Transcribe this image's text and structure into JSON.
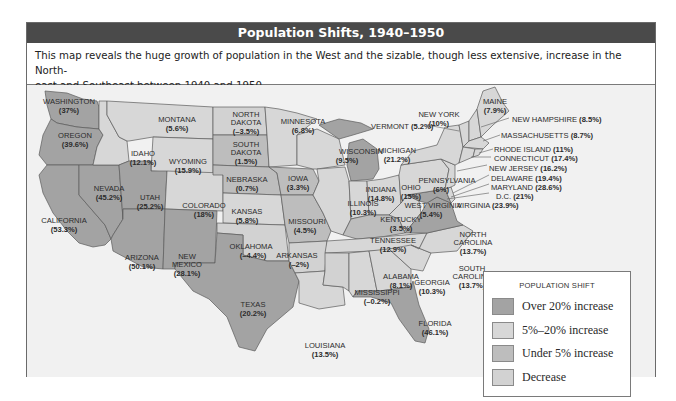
{
  "title": "Population Shifts, 1940–1950",
  "caption": "This map reveals the huge growth of population in the West and the sizable, though less extensive, increase in the North-east and Southeast between 1940 and 1950.",
  "caption_line1": "This map reveals the huge growth of population in the West and the sizable, though less extensive, increase in the North-",
  "caption_line2": "east and Southeast between 1940 and 1950.",
  "colors": {
    "over20": "#a3a3a3",
    "5to20": "#d7d7d7",
    "under5": "#bdbdbd",
    "decrease": "#d2d2d2",
    "background": "#f1f1f1",
    "titlebar": "#4a4a4a"
  },
  "legend": {
    "title": "POPULATION SHIFT",
    "items": [
      {
        "label": "Over 20% increase",
        "category": "over20"
      },
      {
        "label": "5%–20% increase",
        "category": "5to20"
      },
      {
        "label": "Under 5% increase",
        "category": "under5"
      },
      {
        "label": "Decrease",
        "category": "decrease"
      }
    ]
  },
  "states": {
    "washington": {
      "name": "WASHINGTON",
      "value": "(37%)"
    },
    "oregon": {
      "name": "OREGON",
      "value": "(39.6%)"
    },
    "california": {
      "name": "CALIFORNIA",
      "value": "(53.3%)"
    },
    "nevada": {
      "name": "NEVADA",
      "value": "(45.2%)"
    },
    "idaho": {
      "name": "IDAHO",
      "value": "(12.1%)"
    },
    "montana": {
      "name": "MONTANA",
      "value": "(5.6%)"
    },
    "wyoming": {
      "name": "WYOMING",
      "value": "(15.9%)"
    },
    "utah": {
      "name": "UTAH",
      "value": "(25.2%)"
    },
    "colorado": {
      "name": "COLORADO",
      "value": "(18%)"
    },
    "arizona": {
      "name": "ARIZONA",
      "value": "(50.1%)"
    },
    "new_mexico": {
      "name1": "NEW",
      "name2": "MEXICO",
      "value": "(28.1%)"
    },
    "north_dakota": {
      "name1": "NORTH",
      "name2": "DAKOTA",
      "value": "(–3.5%)"
    },
    "south_dakota": {
      "name1": "SOUTH",
      "name2": "DAKOTA",
      "value": "(1.5%)"
    },
    "nebraska": {
      "name": "NEBRASKA",
      "value": "(0.7%)"
    },
    "kansas": {
      "name": "KANSAS",
      "value": "(5.8%)"
    },
    "oklahoma": {
      "name": "OKLAHOMA",
      "value": "(–4.4%)"
    },
    "texas": {
      "name": "TEXAS",
      "value": "(20.2%)"
    },
    "minnesota": {
      "name": "MINNESOTA",
      "value": "(6.8%)"
    },
    "iowa": {
      "name": "IOWA",
      "value": "(3.3%)"
    },
    "missouri": {
      "name": "MISSOURI",
      "value": "(4.5%)"
    },
    "arkansas": {
      "name": "ARKANSAS",
      "value": "(–2%)"
    },
    "louisiana": {
      "name": "LOUISIANA",
      "value": "(13.5%)"
    },
    "wisconsin": {
      "name": "WISCONSIN",
      "value": "(9.5%)"
    },
    "illinois": {
      "name": "ILLINOIS",
      "value": "(10.3%)"
    },
    "michigan": {
      "name": "MICHIGAN",
      "value": "(21.2%)"
    },
    "indiana": {
      "name": "INDIANA",
      "value": "(14.8%)"
    },
    "ohio": {
      "name": "OHIO",
      "value": "(15%)"
    },
    "kentucky": {
      "name": "KENTUCKY",
      "value": "(3.5%)"
    },
    "tennessee": {
      "name": "TENNESSEE",
      "value": "(12.9%)"
    },
    "mississippi": {
      "name": "MISSISSIPPI",
      "value": "(–0.2%)"
    },
    "alabama": {
      "name": "ALABAMA",
      "value": "(8.1%)"
    },
    "georgia": {
      "name": "GEORGIA",
      "value": "(10.3%)"
    },
    "florida": {
      "name": "FLORIDA",
      "value": "(46.1%)"
    },
    "south_carolina": {
      "name1": "SOUTH",
      "name2": "CAROLINA",
      "value": "(13.7%)"
    },
    "north_carolina": {
      "name1": "NORTH",
      "name2": "CAROLINA",
      "value": "(13.7%)"
    },
    "virginia": {
      "name": "VIRGINIA",
      "value": "(23.9%)"
    },
    "west_virginia": {
      "name": "WEST VIRGINIA",
      "value": "(5.4%)"
    },
    "pennsylvania": {
      "name": "PENNSYLVANIA",
      "value": "(6%)"
    },
    "new_york": {
      "name": "NEW YORK",
      "value": "(10%)"
    },
    "vermont": {
      "name": "VERMONT",
      "value": "(5.2%)"
    },
    "maine": {
      "name": "MAINE",
      "value": "(7.9%)"
    },
    "new_hampshire": {
      "name": "NEW HAMPSHIRE",
      "value": "(8.5%)"
    },
    "massachusetts": {
      "name": "MASSACHUSETTS",
      "value": "(8.7%)"
    },
    "rhode_island": {
      "name": "RHODE ISLAND",
      "value": "(11%)"
    },
    "connecticut": {
      "name": "CONNECTICUT",
      "value": "(17.4%)"
    },
    "new_jersey": {
      "name": "NEW JERSEY",
      "value": "(16.2%)"
    },
    "delaware": {
      "name": "DELAWARE",
      "value": "(19.4%)"
    },
    "maryland": {
      "name": "MARYLAND",
      "value": "(28.6%)"
    },
    "dc": {
      "name": "D.C.",
      "value": "(21%)"
    }
  }
}
